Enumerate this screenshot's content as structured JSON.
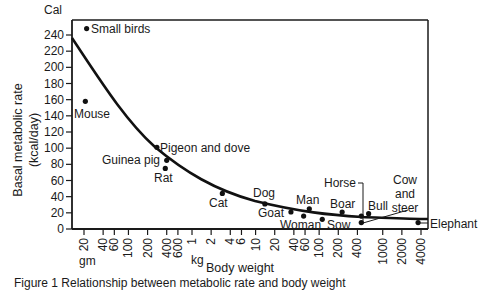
{
  "chart_data": {
    "type": "scatter",
    "title": "",
    "ylabel_unit": "Cal",
    "ylabel_line1": "Basal metabolic rate",
    "ylabel_line2": "(kcal/day)",
    "xlabel": "Body weight",
    "x_scale": "log",
    "x_unit_gm": "gm",
    "x_unit_kg": "kg",
    "ylim": [
      0,
      250
    ],
    "yticks": [
      0,
      20,
      40,
      60,
      80,
      100,
      120,
      140,
      160,
      180,
      200,
      220,
      240
    ],
    "xtick_labels_gm": [
      "20",
      "40",
      "60",
      "100",
      "200",
      "400",
      "600"
    ],
    "xtick_labels_kg": [
      "1",
      "2",
      "4",
      "6",
      "10",
      "20",
      "40",
      "60",
      "100",
      "200",
      "400",
      "1000",
      "2000",
      "4000"
    ],
    "grid": false,
    "legend": "none",
    "points": [
      {
        "label": "Small birds",
        "weight_kg": 0.022,
        "bmr": 248
      },
      {
        "label": "Mouse",
        "weight_kg": 0.021,
        "bmr": 158
      },
      {
        "label": "Pigeon and dove",
        "weight_kg": 0.28,
        "bmr": 101
      },
      {
        "label": "Guinea pig",
        "weight_kg": 0.4,
        "bmr": 85
      },
      {
        "label": "Rat",
        "weight_kg": 0.38,
        "bmr": 75
      },
      {
        "label": "Cat",
        "weight_kg": 3,
        "bmr": 44
      },
      {
        "label": "Dog",
        "weight_kg": 14,
        "bmr": 31
      },
      {
        "label": "Goat",
        "weight_kg": 36,
        "bmr": 21
      },
      {
        "label": "Man",
        "weight_kg": 70,
        "bmr": 25
      },
      {
        "label": "Woman",
        "weight_kg": 57,
        "bmr": 16
      },
      {
        "label": "Boar",
        "weight_kg": 230,
        "bmr": 21
      },
      {
        "label": "Sow",
        "weight_kg": 112,
        "bmr": 12
      },
      {
        "label": "Horse",
        "weight_kg": 460,
        "bmr": 16
      },
      {
        "label": "Bull",
        "weight_kg": 600,
        "bmr": 19
      },
      {
        "label": "Cow and steer",
        "weight_kg": 460,
        "bmr": 8
      },
      {
        "label": "Elephant",
        "weight_kg": 3600,
        "bmr": 8
      }
    ],
    "fit_curve": {
      "description": "decreasing curve of metabolic rate per unit weight vs body weight",
      "approx_points": [
        {
          "weight_kg": 0.015,
          "bmr": 235
        },
        {
          "weight_kg": 0.28,
          "bmr": 100
        },
        {
          "weight_kg": 6,
          "bmr": 36
        },
        {
          "weight_kg": 400,
          "bmr": 16
        },
        {
          "weight_kg": 4500,
          "bmr": 12
        }
      ]
    }
  },
  "labels": {
    "cal": "Cal",
    "ylabel1": "Basal metabolic rate",
    "ylabel2": "(kcal/day)",
    "gm": "gm",
    "kg": "kg",
    "xlabel": "Body weight",
    "caption": "Figure 1 Relationship between metabolic rate and body weight"
  }
}
